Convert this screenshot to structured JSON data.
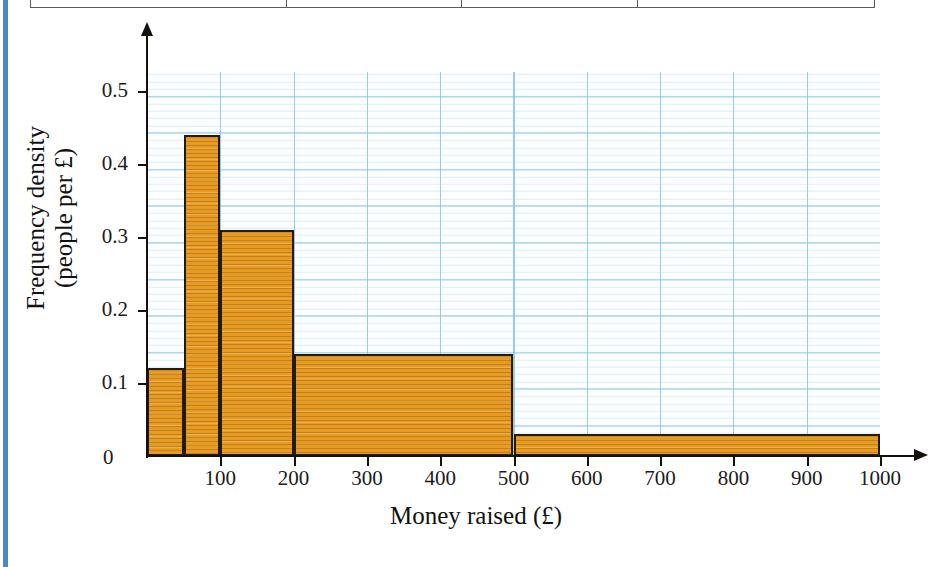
{
  "page": {
    "accent_color": "#4a86c8",
    "table_fragment": {
      "name": "table-bottom-edge",
      "divider_x": [
        285,
        460,
        636
      ]
    }
  },
  "chart_data": {
    "type": "bar",
    "subtype": "histogram",
    "title": "",
    "xlabel": "Money raised (£)",
    "ylabel": "Frequency density\n(people per £)",
    "ylabel_line1": "Frequency density",
    "ylabel_line2": "(people per £)",
    "xlim": [
      0,
      1000
    ],
    "ylim": [
      0,
      0.52
    ],
    "grid": true,
    "grid_color": "#7cbfe8",
    "legend": "none",
    "bar_color": "#e99a20",
    "bar_edge_color": "#241a10",
    "x_ticks": [
      0,
      100,
      200,
      300,
      400,
      500,
      600,
      700,
      800,
      900,
      1000
    ],
    "x_tick_labels": [
      "0",
      "100",
      "200",
      "300",
      "400",
      "500",
      "600",
      "700",
      "800",
      "900",
      "1000"
    ],
    "y_ticks": [
      0,
      0.1,
      0.2,
      0.3,
      0.4,
      0.5
    ],
    "y_tick_labels": [
      "0",
      "0.1",
      "0.2",
      "0.3",
      "0.4",
      "0.5"
    ],
    "bins": [
      {
        "label": "0-50",
        "x0": 0,
        "x1": 50,
        "value": 0.12
      },
      {
        "label": "50-100",
        "x0": 50,
        "x1": 100,
        "value": 0.44
      },
      {
        "label": "100-200",
        "x0": 100,
        "x1": 200,
        "value": 0.31
      },
      {
        "label": "200-500",
        "x0": 200,
        "x1": 500,
        "value": 0.14
      },
      {
        "label": "500-1000",
        "x0": 500,
        "x1": 1000,
        "value": 0.03
      }
    ]
  }
}
